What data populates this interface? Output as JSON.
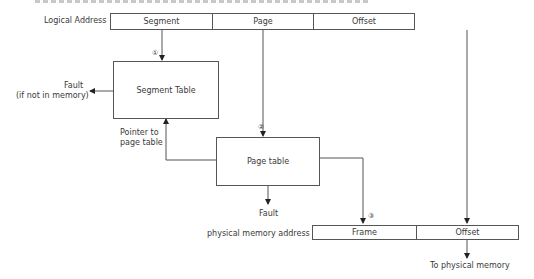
{
  "diagram": {
    "logical_address": {
      "label": "Logical Address",
      "fields": [
        "Segment",
        "Page",
        "Offset"
      ]
    },
    "segment_table": {
      "label": "Segment Table"
    },
    "page_table": {
      "label": "Page table"
    },
    "physical_address": {
      "label": "physical memory address",
      "fields": [
        "Frame",
        "Offset"
      ]
    },
    "annotations": {
      "fault_segment": "Fault",
      "fault_segment_note": "(if not in memory)",
      "pointer_to_page_table_1": "Pointer to",
      "pointer_to_page_table_2": "page table",
      "fault_page": "Fault",
      "to_physical_memory": "To physical memory"
    },
    "steps": [
      "①",
      "②",
      "③"
    ]
  }
}
